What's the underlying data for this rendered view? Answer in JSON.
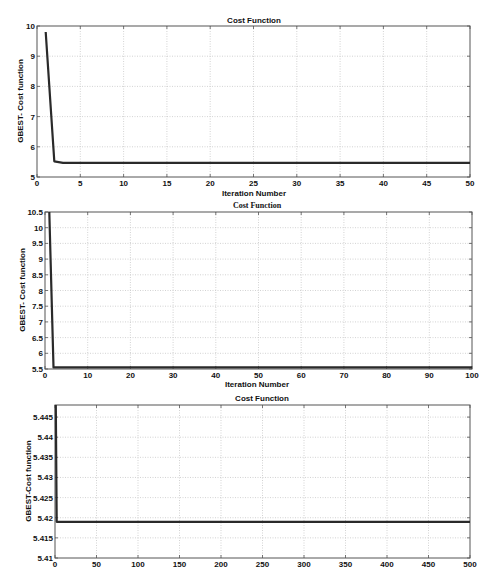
{
  "chart_data": [
    {
      "type": "line",
      "title": "Cost Function",
      "xlabel": "Iteration Number",
      "ylabel": "GBEST- Cost function",
      "xlim": [
        0,
        50
      ],
      "ylim": [
        5,
        10
      ],
      "xticks": [
        0,
        5,
        10,
        15,
        20,
        25,
        30,
        35,
        40,
        45,
        50
      ],
      "yticks": [
        5,
        6,
        7,
        8,
        9,
        10
      ],
      "grid": true,
      "series": [
        {
          "name": "GBEST",
          "x": [
            1,
            2,
            3,
            50
          ],
          "y": [
            9.8,
            5.52,
            5.47,
            5.47
          ]
        }
      ],
      "box": {
        "left": 37,
        "top": 26,
        "right": 470,
        "bottom": 177
      }
    },
    {
      "type": "line",
      "title": "Cost Function",
      "xlabel": "Iteration Number",
      "ylabel": "GBEST- Cost function",
      "xlim": [
        0,
        100
      ],
      "ylim": [
        5.5,
        10.5
      ],
      "xticks": [
        0,
        10,
        20,
        30,
        40,
        50,
        60,
        70,
        80,
        90,
        100
      ],
      "yticks": [
        5.5,
        6,
        6.5,
        7,
        7.5,
        8,
        8.5,
        9,
        9.5,
        10,
        10.5
      ],
      "grid": true,
      "series": [
        {
          "name": "GBEST",
          "x": [
            1,
            2,
            100
          ],
          "y": [
            10.5,
            5.55,
            5.55
          ]
        }
      ],
      "box": {
        "left": 45,
        "top": 212,
        "right": 472,
        "bottom": 369
      }
    },
    {
      "type": "line",
      "title": "Cost Function",
      "xlabel": "",
      "ylabel": "GBEST-Cost function",
      "xlim": [
        0,
        500
      ],
      "ylim": [
        5.41,
        5.448
      ],
      "xticks": [
        0,
        50,
        100,
        150,
        200,
        250,
        300,
        350,
        400,
        450,
        500
      ],
      "yticks": [
        5.41,
        5.415,
        5.42,
        5.425,
        5.43,
        5.435,
        5.44,
        5.445
      ],
      "grid": true,
      "series": [
        {
          "name": "GBEST",
          "x": [
            1,
            2,
            500
          ],
          "y": [
            5.448,
            5.419,
            5.419
          ]
        }
      ],
      "box": {
        "left": 55,
        "top": 405,
        "right": 470,
        "bottom": 558
      }
    }
  ],
  "labels": {
    "chart1_title": "Cost Function",
    "chart1_xlabel": "Iteration Number",
    "chart1_ylabel": "GBEST- Cost function",
    "chart2_title": "Cost Function",
    "chart2_xlabel": "Iteration Number",
    "chart2_ylabel": "GBEST- Cost function",
    "chart3_title": "Cost Function",
    "chart3_ylabel": "GBEST-Cost function"
  }
}
